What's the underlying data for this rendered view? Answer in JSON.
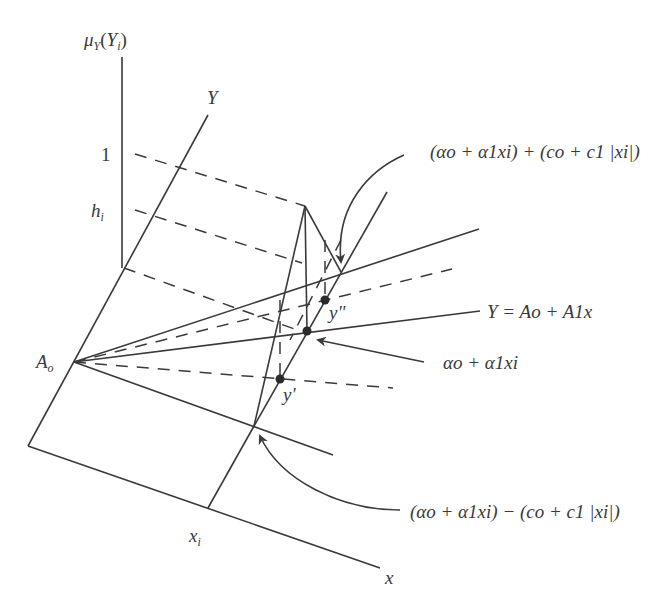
{
  "diagram": {
    "type": "fuzzy-linear-regression-membership-illustration",
    "stroke_color": "#3a3a3a",
    "labels": {
      "mu_axis_mu": "μ",
      "mu_axis_sub": "Y",
      "mu_axis_arg_open": "(Y",
      "mu_axis_arg_sub": "i",
      "mu_axis_arg_close": ")",
      "y_axis": "Y",
      "one_tick": "1",
      "h_tick": "h",
      "h_tick_sub": "i",
      "A0": "A",
      "A0_sub": "o",
      "x_axis": "x",
      "xi": "x",
      "xi_sub": "i",
      "y_double_prime": "y\"",
      "y_prime": "y'",
      "upper_bound": "(αo + α1xi) + (co + c1 |xi|)",
      "regression_line": "Y = Ao + A1x",
      "center_value": "αo + α1xi",
      "lower_bound": "(αo + α1xi) − (co + c1 |xi|)"
    },
    "points": {
      "apex": [
        305,
        206
      ],
      "A0": [
        74,
        362
      ],
      "y_double_prime": [
        325,
        300
      ],
      "center": [
        307,
        331
      ],
      "y_prime": [
        280,
        379
      ],
      "lower_intersection": [
        254,
        426
      ],
      "upper_intersection": [
        341,
        272
      ]
    }
  }
}
